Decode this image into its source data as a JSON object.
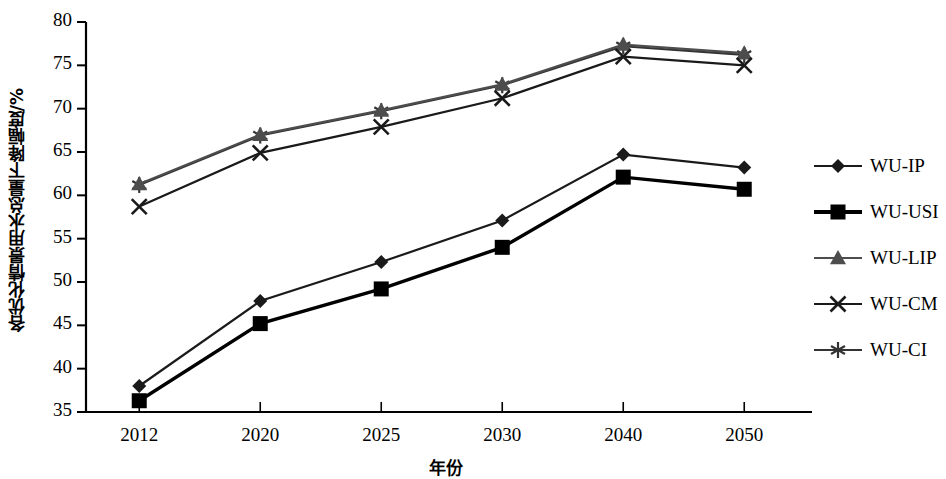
{
  "chart_data": {
    "type": "line",
    "title": "",
    "subtitle": "",
    "xlabel": "年份",
    "ylabel": "各优化情景用水总量下降幅度/%",
    "categories": [
      "2012",
      "2020",
      "2025",
      "2030",
      "2040",
      "2050"
    ],
    "x": [
      2012,
      2020,
      2025,
      2030,
      2040,
      2050
    ],
    "ylim": [
      35,
      80
    ],
    "yticks": [
      35,
      40,
      45,
      50,
      55,
      60,
      65,
      70,
      75,
      80
    ],
    "grid": false,
    "legend_position": "right",
    "series": [
      {
        "name": "WU-IP",
        "marker": "diamond",
        "color": "#1a1a1a",
        "values": [
          38.0,
          47.8,
          52.3,
          57.1,
          64.7,
          63.2
        ]
      },
      {
        "name": "WU-USI",
        "marker": "square",
        "color": "#000000",
        "values": [
          36.3,
          45.2,
          49.2,
          54.0,
          62.1,
          60.7
        ]
      },
      {
        "name": "WU-LIP",
        "marker": "triangle",
        "color": "#4d4d4d",
        "values": [
          61.3,
          67.0,
          69.8,
          72.8,
          77.4,
          76.4
        ]
      },
      {
        "name": "WU-CM",
        "marker": "cross",
        "color": "#1a1a1a",
        "values": [
          58.7,
          64.9,
          67.9,
          71.2,
          76.0,
          75.0
        ]
      },
      {
        "name": "WU-CI",
        "marker": "star",
        "color": "#333333",
        "values": [
          61.2,
          66.9,
          69.7,
          72.7,
          77.2,
          76.2
        ]
      }
    ]
  },
  "axes": {
    "y_tick_labels": [
      "80",
      "75",
      "70",
      "65",
      "60",
      "55",
      "50",
      "45",
      "40",
      "35"
    ],
    "x_tick_labels": [
      "2012",
      "2020",
      "2025",
      "2030",
      "2040",
      "2050"
    ],
    "y_axis_title": "各优化情景用水总量下降幅度/%",
    "x_axis_title": "年份"
  },
  "legend": {
    "items": [
      {
        "label": "WU-IP",
        "marker": "diamond-marker"
      },
      {
        "label": "WU-USI",
        "marker": "square-marker"
      },
      {
        "label": "WU-LIP",
        "marker": "triangle-marker"
      },
      {
        "label": "WU-CM",
        "marker": "cross-marker"
      },
      {
        "label": "WU-CI",
        "marker": "star-marker"
      }
    ]
  },
  "colors": {
    "axis": "#000000",
    "background": "#ffffff",
    "series_dark": "#1a1a1a",
    "series_gray": "#4d4d4d"
  }
}
